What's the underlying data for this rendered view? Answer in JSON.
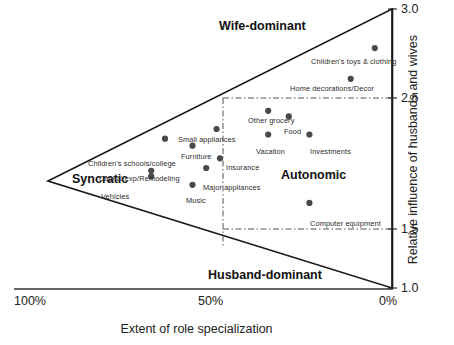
{
  "chart_data": {
    "type": "scatter",
    "title": "",
    "xlabel": "Extent of role specialization",
    "ylabel": "Relative influence of husbands and wives",
    "xticks": [
      "100%",
      "50%",
      "0%"
    ],
    "xtick_values": [
      100,
      50,
      0
    ],
    "yticks": [
      "3.0",
      "2.5",
      "1.5",
      "1.0"
    ],
    "ytick_values": [
      3.0,
      2.5,
      1.5,
      1.0
    ],
    "xlim": [
      100,
      0
    ],
    "ylim": [
      1.0,
      3.0
    ],
    "grid": false,
    "legend": "none",
    "region_labels": [
      {
        "text": "Wife-dominant",
        "x": 34,
        "y": 2.83
      },
      {
        "text": "Husband-dominant",
        "x": 34,
        "y": 1.13
      },
      {
        "text": "Syncratic",
        "x": 85,
        "y": 1.86
      },
      {
        "text": "Autonomic",
        "x": 22,
        "y": 1.8
      }
    ],
    "reference_lines": [
      {
        "orientation": "vertical",
        "value": 50,
        "style": "dash-dot"
      },
      {
        "orientation": "horizontal",
        "value": 2.5,
        "style": "dash-dot"
      },
      {
        "orientation": "horizontal",
        "value": 1.5,
        "style": "dash-dot"
      }
    ],
    "points": [
      {
        "label": "Children's toys & clothing",
        "x": 5,
        "y": 2.72,
        "label_pos": "left"
      },
      {
        "label": "Home decorations/Decor",
        "x": 12,
        "y": 2.5,
        "label_pos": "above-left"
      },
      {
        "label": "Other grocery",
        "x": 36,
        "y": 2.27,
        "label_pos": "above"
      },
      {
        "label": "Food",
        "x": 30,
        "y": 2.23,
        "label_pos": "right"
      },
      {
        "label": "Vacation",
        "x": 36,
        "y": 2.1,
        "label_pos": "right"
      },
      {
        "label": "Investments",
        "x": 24,
        "y": 2.1,
        "label_pos": "right"
      },
      {
        "label": "Small appliances",
        "x": 51,
        "y": 2.14,
        "label_pos": "above-left"
      },
      {
        "label": "Children's schools/college",
        "x": 66,
        "y": 2.07,
        "label_pos": "below-left"
      },
      {
        "label": "Furniture",
        "x": 58,
        "y": 2.02,
        "label_pos": "right"
      },
      {
        "label": "Insurance",
        "x": 50,
        "y": 1.93,
        "label_pos": "right"
      },
      {
        "label": "Capital exp/Remodeling",
        "x": 70,
        "y": 1.84,
        "label_pos": "above-right"
      },
      {
        "label": "Major appliances",
        "x": 54,
        "y": 1.86,
        "label_pos": "below-left"
      },
      {
        "label": "Vehicles",
        "x": 70,
        "y": 1.8,
        "label_pos": "below"
      },
      {
        "label": "Music",
        "x": 58,
        "y": 1.74,
        "label_pos": "right"
      },
      {
        "label": "Computer equipment",
        "x": 24,
        "y": 1.61,
        "label_pos": "right"
      }
    ]
  },
  "axes": {
    "x_title": "Extent of role specialization",
    "y_title": "Relative influence of husbands and wives",
    "x_ticks": [
      {
        "text": "100%",
        "px": 44
      },
      {
        "text": "50%",
        "px": 211
      },
      {
        "text": "0%",
        "px": 384
      }
    ],
    "y_ticks": [
      {
        "text": "3.0",
        "px": 2
      },
      {
        "text": "2.5",
        "px": 92
      },
      {
        "text": "1.5",
        "px": 222
      },
      {
        "text": "1.0",
        "px": 282
      }
    ]
  },
  "regions": {
    "wife_dominant": "Wife-dominant",
    "husband_dominant": "Husband-dominant",
    "syncratic": "Syncratic",
    "autonomic": "Autonomic"
  },
  "series_labels": {
    "p0": "Children's toys & clothing",
    "p1": "Home decorations/Decor",
    "p2": "Other grocery",
    "p3": "Food",
    "p4": "Vacation",
    "p5": "Investments",
    "p6": "Small appliances",
    "p7": "Children's schools/college",
    "p8": "Furniture",
    "p9": "Insurance",
    "p10": "Capital exp/Remodeling",
    "p11": "Major appliances",
    "p12": "Vehicles",
    "p13": "Music",
    "p14": "Computer equipment"
  },
  "colors": {
    "point": "#4a4a4a",
    "axis": "#1a1a1a",
    "reference_line": "#555555",
    "background": "#ffffff"
  }
}
